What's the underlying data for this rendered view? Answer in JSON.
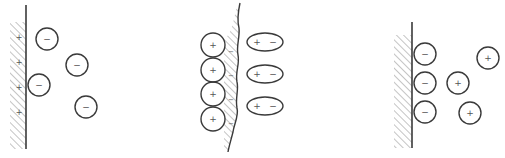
{
  "diagram": {
    "colors": {
      "line": "#3a3a3a",
      "hatch": "#8a8a8a",
      "sign": "#555555",
      "background": "#ffffff"
    },
    "panels": [
      {
        "id": "panel-1",
        "description": "Positively charged planar wall with loosely distributed negative ions",
        "wall": {
          "type": "straight",
          "x": 26,
          "y1": 5,
          "y2": 149,
          "hatch_x": 10,
          "hatch_y1": 22,
          "hatch_y2": 149,
          "charge_marks": [
            "+",
            "+",
            "+",
            "+"
          ],
          "charge_mark_ys": [
            37,
            62,
            87,
            112
          ],
          "charge_mark_x": 19
        },
        "ions": [
          {
            "sign": "−",
            "cx": 47,
            "cy": 39,
            "r": 11
          },
          {
            "sign": "−",
            "cx": 77,
            "cy": 65,
            "r": 11
          },
          {
            "sign": "−",
            "cx": 39,
            "cy": 85,
            "r": 11
          },
          {
            "sign": "−",
            "cx": 86,
            "cy": 107,
            "r": 11
          }
        ]
      },
      {
        "id": "panel-2",
        "description": "Rough wall with adsorbed positive ion layer and oriented dipoles",
        "wall": {
          "type": "rough",
          "charge_marks": [
            "−",
            "−",
            "−",
            "−"
          ]
        },
        "ions": [
          {
            "sign": "+",
            "cx": 213,
            "cy": 45,
            "r": 12
          },
          {
            "sign": "+",
            "cx": 213,
            "cy": 70,
            "r": 12
          },
          {
            "sign": "+",
            "cx": 213,
            "cy": 94,
            "r": 12
          },
          {
            "sign": "+",
            "cx": 213,
            "cy": 119,
            "r": 12
          }
        ],
        "dipoles": [
          {
            "left": "+",
            "right": "−",
            "cx": 265,
            "cy": 42,
            "rx": 18,
            "ry": 9
          },
          {
            "left": "+",
            "right": "−",
            "cx": 265,
            "cy": 74,
            "rx": 18,
            "ry": 9
          },
          {
            "left": "+",
            "right": "−",
            "cx": 265,
            "cy": 106,
            "rx": 18,
            "ry": 9
          }
        ]
      },
      {
        "id": "panel-3",
        "description": "Planar wall with layer of negative ions and diffuse positive ions",
        "wall": {
          "type": "straight",
          "x": 412,
          "y1": 22,
          "y2": 148,
          "hatch_x": 394,
          "hatch_y1": 35,
          "hatch_y2": 148
        },
        "ions": [
          {
            "sign": "−",
            "cx": 425,
            "cy": 54,
            "r": 11
          },
          {
            "sign": "−",
            "cx": 425,
            "cy": 83,
            "r": 11
          },
          {
            "sign": "−",
            "cx": 425,
            "cy": 112,
            "r": 11
          },
          {
            "sign": "+",
            "cx": 488,
            "cy": 58,
            "r": 11
          },
          {
            "sign": "+",
            "cx": 458,
            "cy": 83,
            "r": 11
          },
          {
            "sign": "+",
            "cx": 470,
            "cy": 113,
            "r": 11
          }
        ]
      }
    ]
  }
}
